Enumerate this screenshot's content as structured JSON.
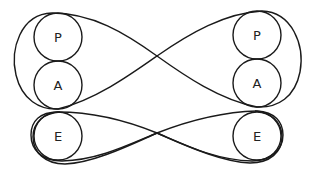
{
  "diagram": {
    "type": "transactional-analysis-ego-state-diagram",
    "stroke_color": "#1a1a1a",
    "background": "#ffffff",
    "left_person": {
      "states": [
        {
          "label": "P",
          "cx": 58,
          "cy": 37,
          "r": 24
        },
        {
          "label": "A",
          "cx": 58,
          "cy": 85,
          "r": 24
        },
        {
          "label": "E",
          "cx": 58,
          "cy": 136,
          "r": 24
        }
      ]
    },
    "right_person": {
      "states": [
        {
          "label": "P",
          "cx": 257,
          "cy": 35,
          "r": 24
        },
        {
          "label": "A",
          "cx": 257,
          "cy": 83,
          "r": 24
        },
        {
          "label": "E",
          "cx": 257,
          "cy": 136,
          "r": 24
        }
      ]
    },
    "transactions": [
      {
        "from": "left-P",
        "to": "right-A",
        "kind": "crossed-upper"
      },
      {
        "from": "right-P",
        "to": "left-A",
        "kind": "crossed-upper"
      },
      {
        "from": "left-E",
        "to": "right-E",
        "kind": "crossed-lower"
      },
      {
        "from": "right-E",
        "to": "left-E",
        "kind": "crossed-lower"
      }
    ]
  }
}
